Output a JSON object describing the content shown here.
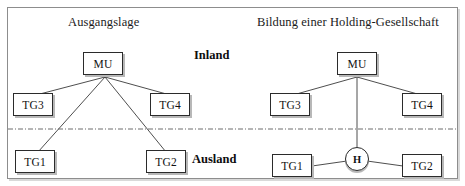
{
  "figure": {
    "panels": [
      {
        "id": "left",
        "title": "Ausgangslage"
      },
      {
        "id": "right",
        "title": "Bildung einer Holding-Gesellschaft"
      }
    ],
    "regions": {
      "upper_label": "Inland",
      "lower_label": "Ausland"
    },
    "nodes": {
      "left_mu": "MU",
      "left_tg3": "TG3",
      "left_tg4": "TG4",
      "left_tg1": "TG1",
      "left_tg2": "TG2",
      "right_mu": "MU",
      "right_tg3": "TG3",
      "right_tg4": "TG4",
      "right_tg1": "TG1",
      "right_tg2": "TG2",
      "right_holding": "H"
    },
    "colors": {
      "frame_border": "#8d8d8d",
      "node_border": "#2b2b2b",
      "edge": "#3a3a3a",
      "divider": "#6e6e6e",
      "shadow": "#b8b8b8",
      "background": "#ffffff"
    }
  }
}
